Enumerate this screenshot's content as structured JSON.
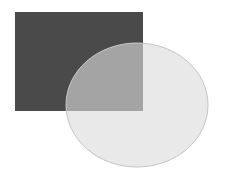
{
  "diagram": {
    "background": "#ffffff",
    "shapes": [
      {
        "id": "rectangle",
        "type": "rect",
        "x": 15,
        "y": 12,
        "width": 128,
        "height": 99,
        "fill": "#4a4a4a",
        "opacity": 1
      },
      {
        "id": "ellipse",
        "type": "ellipse",
        "cx": 137,
        "cy": 105,
        "rx": 71,
        "ry": 62,
        "fill": "#eeeeee",
        "opacity": 0.55,
        "stroke": "#c4c4c4"
      }
    ],
    "overlap_color": "#a4a4a4"
  }
}
